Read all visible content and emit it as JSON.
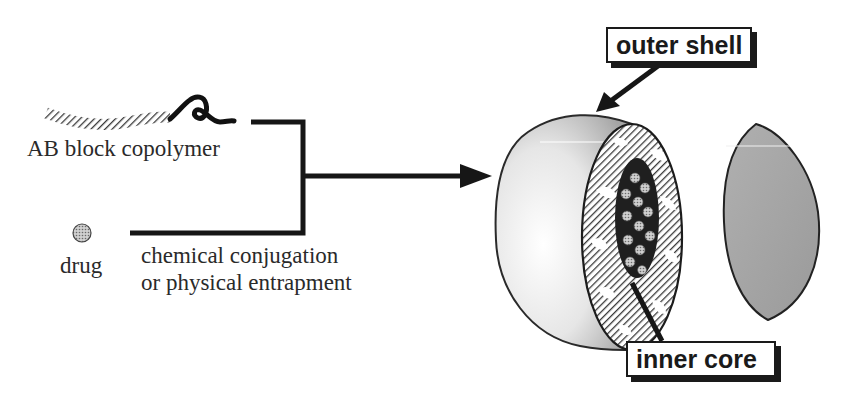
{
  "diagram": {
    "inputs": {
      "copolymer_label": "AB block copolymer",
      "drug_label": "drug"
    },
    "process_label": {
      "line1": "chemical conjugation",
      "line2": "or physical entrapment"
    },
    "callouts": {
      "outer": "outer shell",
      "inner": "inner core"
    },
    "colors": {
      "line": "#1a1a1a",
      "shell_light": "#f2f2f2",
      "shell_dark": "#9a9a9a",
      "cap_fill": "#a3a3a3",
      "hatch": "#4a4a4a",
      "core": "#222222",
      "drug_dot": "#9c9c9c"
    }
  }
}
